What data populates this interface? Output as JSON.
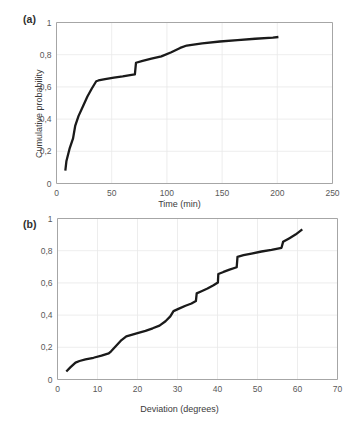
{
  "figure": {
    "background": "#ffffff",
    "line_color": "#1a1a1a",
    "grid_color": "#e8e8e8",
    "axis_color": "#a6a6a6"
  },
  "panel_a": {
    "label": "(a)",
    "ylabel": "Cumulative probability",
    "xlabel": "Time (min)"
  },
  "panel_b": {
    "label": "(b)",
    "ylabel": "Cumulative probability",
    "xlabel": "Deviation (degrees)"
  },
  "chart_data": [
    {
      "type": "line",
      "panel": "(a)",
      "title": "",
      "xlabel": "Time (min)",
      "ylabel": "Cumulative probability",
      "xlim": [
        0,
        250
      ],
      "ylim": [
        0,
        1
      ],
      "xticks": [
        0,
        50,
        100,
        150,
        200,
        250
      ],
      "xtick_labels": [
        "0",
        "50",
        "100",
        "150",
        "200",
        "250"
      ],
      "yticks": [
        0,
        0.2,
        0.4,
        0.6,
        0.8,
        1
      ],
      "ytick_labels": [
        "0",
        "0,2",
        "0,4",
        "0,6",
        "0,8",
        "1"
      ],
      "grid": true,
      "legend": false,
      "series": [
        {
          "name": "Cumulative probability of time",
          "x": [
            8,
            9,
            12,
            15,
            17,
            20,
            24,
            28,
            32,
            36,
            38,
            44,
            52,
            60,
            68,
            71,
            72,
            78,
            86,
            95,
            104,
            112,
            118,
            121,
            132,
            148,
            164,
            180,
            196,
            201
          ],
          "y": [
            0.08,
            0.14,
            0.22,
            0.28,
            0.36,
            0.42,
            0.48,
            0.54,
            0.59,
            0.635,
            0.64,
            0.648,
            0.657,
            0.665,
            0.675,
            0.678,
            0.75,
            0.762,
            0.775,
            0.79,
            0.815,
            0.842,
            0.857,
            0.86,
            0.871,
            0.882,
            0.891,
            0.899,
            0.906,
            0.91
          ]
        }
      ]
    },
    {
      "type": "line",
      "panel": "(b)",
      "title": "",
      "xlabel": "Deviation (degrees)",
      "ylabel": "Cumulative probability",
      "xlim": [
        0,
        70
      ],
      "ylim": [
        0,
        1
      ],
      "xticks": [
        0,
        10,
        20,
        30,
        40,
        50,
        60,
        70
      ],
      "xtick_labels": [
        "0",
        "10",
        "20",
        "30",
        "40",
        "50",
        "60",
        "70"
      ],
      "yticks": [
        0,
        0.2,
        0.4,
        0.6,
        0.8,
        1
      ],
      "ytick_labels": [
        "0",
        "0,2",
        "0,4",
        "0,6",
        "0,8",
        "1"
      ],
      "grid": true,
      "legend": false,
      "series": [
        {
          "name": "Cumulative probability of deviation",
          "x": [
            2.2,
            3.2,
            4.5,
            5.5,
            7.0,
            9.0,
            11.0,
            12.8,
            13.4,
            14.5,
            16.0,
            17.2,
            18.5,
            20.0,
            22.0,
            23.8,
            25.5,
            27.0,
            28.2,
            29.0,
            30.5,
            32.0,
            33.5,
            34.6,
            34.8,
            36.0,
            37.5,
            39.0,
            40.1,
            40.2,
            41.5,
            43.0,
            44.8,
            45.0,
            46.5,
            48.5,
            51.0,
            53.5,
            56.0,
            56.4,
            58.0,
            59.5,
            61.2
          ],
          "y": [
            0.05,
            0.075,
            0.105,
            0.115,
            0.125,
            0.135,
            0.148,
            0.162,
            0.175,
            0.205,
            0.245,
            0.268,
            0.277,
            0.288,
            0.302,
            0.318,
            0.335,
            0.362,
            0.392,
            0.425,
            0.442,
            0.458,
            0.472,
            0.487,
            0.535,
            0.548,
            0.565,
            0.585,
            0.602,
            0.655,
            0.668,
            0.682,
            0.697,
            0.762,
            0.772,
            0.782,
            0.795,
            0.805,
            0.818,
            0.855,
            0.878,
            0.9,
            0.932
          ]
        }
      ]
    }
  ]
}
